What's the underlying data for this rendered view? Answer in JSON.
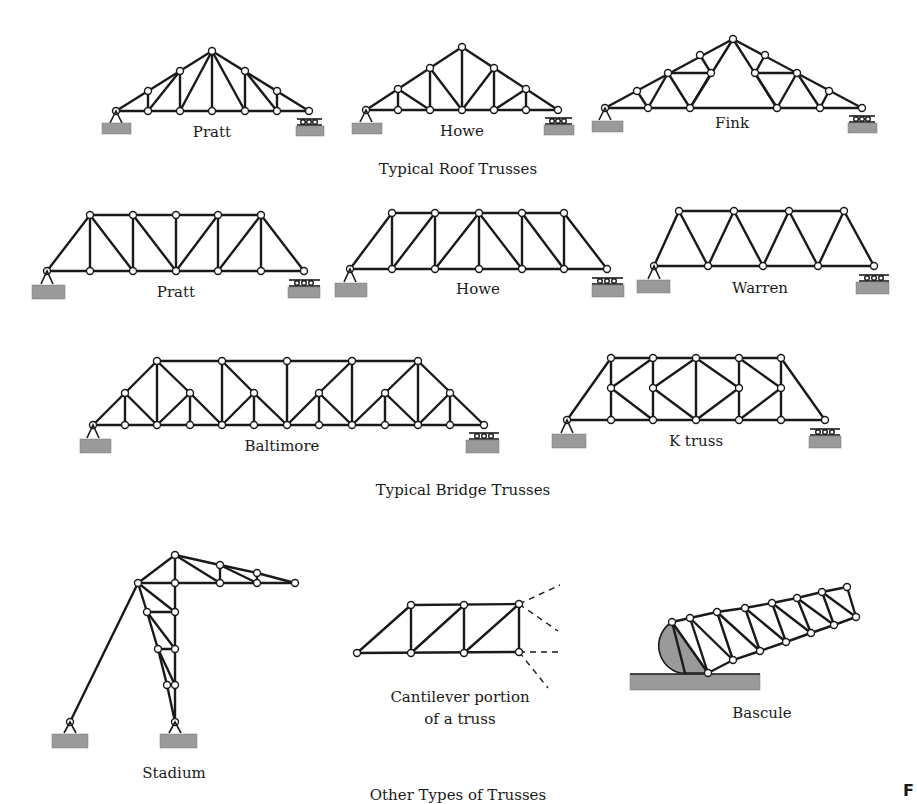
{
  "figure": {
    "sections": [
      {
        "caption": "Typical Roof Trusses",
        "trusses": [
          {
            "name": "Pratt"
          },
          {
            "name": "Howe"
          },
          {
            "name": "Fink"
          }
        ]
      },
      {
        "caption": "Typical Bridge Trusses",
        "trusses": [
          {
            "name": "Pratt"
          },
          {
            "name": "Howe"
          },
          {
            "name": "Warren"
          },
          {
            "name": "Baltimore"
          },
          {
            "name": "K truss"
          }
        ]
      },
      {
        "caption": "Other Types of Trusses",
        "trusses": [
          {
            "name": "Stadium"
          },
          {
            "name": "Cantilever portion",
            "name_line2": "of a truss"
          },
          {
            "name": "Bascule"
          }
        ]
      }
    ],
    "corner_mark": "F"
  },
  "colors": {
    "line": "#1a1a1a",
    "ground": "#9a9a9a",
    "background": "#ffffff"
  }
}
